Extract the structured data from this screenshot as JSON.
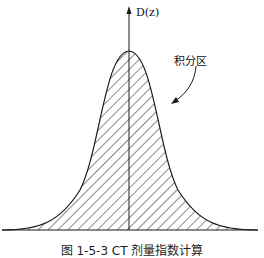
{
  "figure": {
    "axis_label": "D(z)",
    "region_label": "积分区",
    "caption": "图 1-5-3   CT 剂量指数计算",
    "colors": {
      "line": "#1a1a1a",
      "hatch": "#1a1a1a",
      "background": "#ffffff"
    }
  }
}
